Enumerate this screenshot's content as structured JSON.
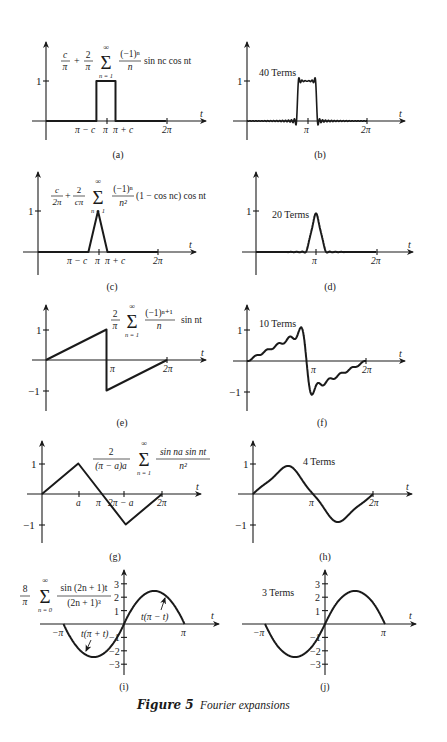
{
  "figure": {
    "caption_label": "Figure 5",
    "caption_text": "Fourier expansions"
  },
  "chart_data": [
    {
      "id": "a",
      "type": "line",
      "label": "(a)",
      "title": "c/π + (2/π) Σ_{n=1}^{∞} ((-1)^n / n) sin nc cos nt",
      "formula_parts": {
        "lead": "c",
        "lead_den": "π",
        "coef": "2",
        "coef_den": "π",
        "num": "(−1)ⁿ",
        "den": "n",
        "tail": "sin nc cos nt",
        "sum_lower": "n = 1",
        "sum_upper": "∞"
      },
      "xlabel": "t",
      "ylabel": "",
      "x_ticks": [
        "π − c",
        "π",
        "π + c",
        "2π"
      ],
      "y_ticks": [
        "1"
      ],
      "description": "Rectangular pulse of height 1 from π−c to π+c",
      "points": [
        [
          0,
          0
        ],
        [
          2.64,
          0
        ],
        [
          2.64,
          1
        ],
        [
          3.64,
          1
        ],
        [
          3.64,
          0
        ],
        [
          6.28,
          0
        ]
      ],
      "ylim": [
        0,
        1.4
      ]
    },
    {
      "id": "b",
      "type": "line",
      "label": "(b)",
      "annotation": "40 Terms",
      "xlabel": "t",
      "x_ticks": [
        "π",
        "2π"
      ],
      "y_ticks": [
        "1"
      ],
      "terms": 40,
      "description": "40-term partial sum of (a), pulse with Gibbs ripples",
      "ylim": [
        0,
        1.4
      ]
    },
    {
      "id": "c",
      "type": "line",
      "label": "(c)",
      "title": "c/(2π) + (2/(cπ)) Σ_{n=1}^{∞} ((-1)^n / n²)(1 − cos nc) cos nt",
      "formula_parts": {
        "lead": "c",
        "lead_den": "2π",
        "coef": "2",
        "coef_den": "cπ",
        "num": "(−1)ⁿ",
        "den": "n²",
        "tail": "(1 − cos nc) cos nt",
        "sum_lower": "n = 1",
        "sum_upper": "∞"
      },
      "xlabel": "t",
      "x_ticks": [
        "π − c",
        "π",
        "π + c",
        "2π"
      ],
      "y_ticks": [
        "1"
      ],
      "description": "Triangular pulse peaking at 1 at t = π, base π−c to π+c",
      "points": [
        [
          0,
          0
        ],
        [
          2.64,
          0
        ],
        [
          3.1416,
          1
        ],
        [
          3.64,
          0
        ],
        [
          6.28,
          0
        ]
      ],
      "ylim": [
        0,
        1.4
      ]
    },
    {
      "id": "d",
      "type": "line",
      "label": "(d)",
      "annotation": "20 Terms",
      "xlabel": "t",
      "x_ticks": [
        "π",
        "2π"
      ],
      "y_ticks": [
        "1"
      ],
      "terms": 20,
      "description": "20-term partial sum of (c)",
      "ylim": [
        0,
        1.4
      ]
    },
    {
      "id": "e",
      "type": "line",
      "label": "(e)",
      "title": "(2/π) Σ_{n=1}^{∞} ((-1)^{n+1} / n) sin nt",
      "formula_parts": {
        "coef": "2",
        "coef_den": "π",
        "num": "(−1)ⁿ⁺¹",
        "den": "n",
        "tail": "sin nt",
        "sum_lower": "n = 1",
        "sum_upper": "∞"
      },
      "xlabel": "t",
      "x_ticks": [
        "π",
        "2π"
      ],
      "y_ticks": [
        "1",
        "−1"
      ],
      "description": "Sawtooth t/π from 0 to π, jump to −1, rising to 0 at 2π",
      "points": [
        [
          0,
          0
        ],
        [
          3.1416,
          1
        ],
        [
          3.1416,
          -1
        ],
        [
          6.2832,
          0
        ]
      ],
      "ylim": [
        -1.5,
        1.5
      ]
    },
    {
      "id": "f",
      "type": "line",
      "label": "(f)",
      "annotation": "10 Terms",
      "xlabel": "t",
      "x_ticks": [
        "π",
        "2π"
      ],
      "y_ticks": [
        "1",
        "−1"
      ],
      "terms": 10,
      "description": "10-term partial sum of sawtooth (e)",
      "ylim": [
        -1.5,
        1.5
      ]
    },
    {
      "id": "g",
      "type": "line",
      "label": "(g)",
      "title": "(2/((π − a)a)) Σ_{n=1}^{∞} (sin na sin nt / n²)",
      "formula_parts": {
        "coef": "2",
        "coef_den": "(π − a)a",
        "num": "sin na sin nt",
        "den": "n²",
        "sum_lower": "n = 1",
        "sum_upper": "∞"
      },
      "xlabel": "t",
      "x_ticks": [
        "a",
        "π",
        "2π − a",
        "2π"
      ],
      "y_ticks": [
        "1",
        "−1"
      ],
      "description": "Triangle wave: 0→1 at a, down to −1 at 2π−a, back to 0 at 2π",
      "points": [
        [
          0,
          0
        ],
        [
          1.9,
          1
        ],
        [
          3.1416,
          0
        ],
        [
          4.38,
          -1
        ],
        [
          6.2832,
          0
        ]
      ],
      "ylim": [
        -1.5,
        1.5
      ]
    },
    {
      "id": "h",
      "type": "line",
      "label": "(h)",
      "annotation": "4 Terms",
      "xlabel": "t",
      "x_ticks": [
        "π",
        "2π"
      ],
      "y_ticks": [
        "1",
        "−1"
      ],
      "terms": 4,
      "description": "4-term partial sum of (g)",
      "ylim": [
        -1.5,
        1.5
      ]
    },
    {
      "id": "i",
      "type": "line",
      "label": "(i)",
      "title": "(8/π) Σ_{n=0}^{∞} sin(2n+1)t / (2n+1)³",
      "formula_parts": {
        "coef": "8",
        "coef_den": "π",
        "num": "sin (2n + 1)t",
        "den": "(2n + 1)³",
        "sum_lower": "n = 0",
        "sum_upper": "∞"
      },
      "xlabel": "t",
      "x_ticks": [
        "−π",
        "π"
      ],
      "y_ticks": [
        "3",
        "2",
        "1",
        "−1",
        "−2",
        "−3"
      ],
      "annotations": [
        "t(π + t)",
        "t(π − t)"
      ],
      "description": "Piecewise parabola: t(π+t) on [−π,0], t(π−t) on [0,π]; peak ≈ ±2.47",
      "ylim": [
        -3.5,
        3.5
      ]
    },
    {
      "id": "j",
      "type": "line",
      "label": "(j)",
      "annotation": "3 Terms",
      "xlabel": "t",
      "x_ticks": [
        "−π",
        "π"
      ],
      "y_ticks": [
        "3",
        "2",
        "1",
        "−1",
        "−2",
        "−3"
      ],
      "terms": 3,
      "description": "3-term partial sum of (i)",
      "ylim": [
        -3.5,
        3.5
      ]
    }
  ]
}
